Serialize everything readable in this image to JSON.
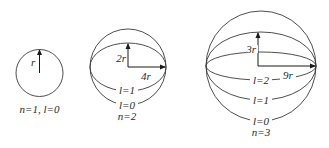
{
  "diagram": {
    "orbits": [
      {
        "n": 1,
        "caption": "n=1, l=0",
        "radius_label": "r",
        "sub_orbits": []
      },
      {
        "n": 2,
        "caption": "n=2",
        "minor_label": "2r",
        "major_label": "4r",
        "sub_orbits": [
          {
            "l": 1,
            "label": "l=1"
          },
          {
            "l": 0,
            "label": "l=0"
          }
        ]
      },
      {
        "n": 3,
        "caption": "n=3",
        "minor_label": "3r",
        "major_label": "9r",
        "sub_orbits": [
          {
            "l": 2,
            "label": "l=2"
          },
          {
            "l": 1,
            "label": "l=1"
          },
          {
            "l": 0,
            "label": "l=0"
          }
        ]
      }
    ],
    "colors": {
      "stroke": "#3a3a3a",
      "text": "#2a2a2a",
      "background": "#ffffff"
    }
  }
}
